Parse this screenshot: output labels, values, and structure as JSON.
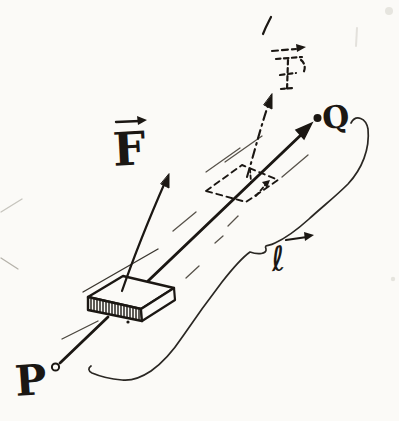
{
  "figure": {
    "type": "hand-drawn-physics-sketch",
    "background": "#fbfaf7",
    "ink": "#1b1713",
    "labels": {
      "start_point": "P",
      "end_point": "Q",
      "force": "F",
      "ghost_force": "F",
      "displacement": "ℓ"
    }
  }
}
